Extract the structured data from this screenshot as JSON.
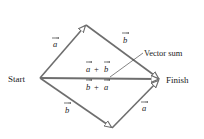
{
  "diagram": {
    "type": "vector-addition-parallelogram",
    "colors": {
      "line": "#6e6e6e",
      "text": "#1a1a1a",
      "background": "#ffffff"
    },
    "points": {
      "start": {
        "label": "Start"
      },
      "finish": {
        "label": "Finish"
      }
    },
    "annotation": {
      "label": "Vector sum"
    },
    "vectors": [
      {
        "id": "upper-a",
        "symbol": "a",
        "from": "start",
        "to": "top-vertex"
      },
      {
        "id": "upper-b",
        "symbol": "b",
        "from": "top-vertex",
        "to": "finish"
      },
      {
        "id": "lower-b",
        "symbol": "b",
        "from": "start",
        "to": "bottom-vertex"
      },
      {
        "id": "lower-a",
        "symbol": "a",
        "from": "bottom-vertex",
        "to": "finish"
      },
      {
        "id": "sum",
        "from": "start",
        "to": "finish"
      }
    ],
    "sum_labels": {
      "upper": {
        "left": "a",
        "op": "+",
        "right": "b"
      },
      "lower": {
        "left": "b",
        "op": "+",
        "right": "a"
      }
    }
  }
}
